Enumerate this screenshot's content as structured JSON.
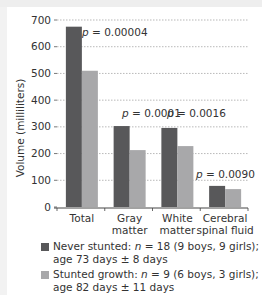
{
  "chart_data": {
    "type": "bar",
    "title": "",
    "xlabel": "",
    "ylabel": "Volume (milliliters)",
    "ylim": [
      0,
      700
    ],
    "yticks": [
      0,
      100,
      200,
      300,
      400,
      500,
      600,
      700
    ],
    "grid": true,
    "categories": [
      "Total",
      "Gray matter",
      "White matter",
      "Cerebral spinal fluid"
    ],
    "series": [
      {
        "name": "Never stunted: n = 18 (9 boys, 9 girls); age 73 days ± 8 days",
        "color": "#58585a",
        "values": [
          675,
          303,
          296,
          79
        ]
      },
      {
        "name": "Stunted growth: n = 9 (6 boys, 3 girls); age 82 days ± 11 days",
        "color": "#a8a8aa",
        "values": [
          510,
          213,
          228,
          67
        ]
      }
    ],
    "annotations": [
      "p = 0.00004",
      "p = 0.0001",
      "p = 0.0016",
      "p = 0.0090"
    ],
    "legend_position": "bottom"
  },
  "axis": {
    "ylabel": "Volume (milliliters)",
    "yticks": [
      "0",
      "100",
      "200",
      "300",
      "400",
      "500",
      "600",
      "700"
    ],
    "categories": [
      {
        "line1": "Total",
        "line2": ""
      },
      {
        "line1": "Gray",
        "line2": "matter"
      },
      {
        "line1": "White",
        "line2": "matter"
      },
      {
        "line1": "Cerebral",
        "line2": "spinal fluid"
      }
    ]
  },
  "pvalues": [
    {
      "p": "p",
      "eq": " = 0.00004"
    },
    {
      "p": "p",
      "eq": " = 0.0001"
    },
    {
      "p": "p",
      "eq": " = 0.0016"
    },
    {
      "p": "p",
      "eq": " = 0.0090"
    }
  ],
  "legend": {
    "items": [
      {
        "color": "#58585a",
        "line1_a": "Never stunted: ",
        "n": "n",
        "line1_b": " = 18 (9 boys, 9 girls);",
        "line2": "age 73 days ± 8 days"
      },
      {
        "color": "#a8a8aa",
        "line1_a": "Stunted growth: ",
        "n": "n",
        "line1_b": " = 9 (6 boys, 3 girls);",
        "line2": "age 82 days ± 11 days"
      }
    ]
  }
}
